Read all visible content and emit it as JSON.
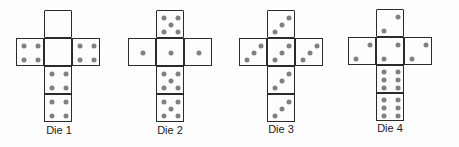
{
  "figure": {
    "type": "cube nets",
    "pip_color": "#808080",
    "line_color": "#2a2a2a",
    "dice": [
      {
        "label": "Die 1",
        "faces": {
          "top": 0,
          "left": 4,
          "center": 0,
          "right": 4,
          "below1": 4,
          "below2": 4
        }
      },
      {
        "label": "Die 2",
        "faces": {
          "top": 5,
          "left": 1,
          "center": 1,
          "right": 1,
          "below1": 5,
          "below2": 5
        }
      },
      {
        "label": "Die 3",
        "faces": {
          "top": 3,
          "left": 3,
          "center": 3,
          "right": 3,
          "below1": 3,
          "below2": 3
        }
      },
      {
        "label": "Die 4",
        "faces": {
          "top": 2,
          "left": 2,
          "center": 2,
          "right": 2,
          "below1": 6,
          "below2": 6
        }
      }
    ]
  }
}
